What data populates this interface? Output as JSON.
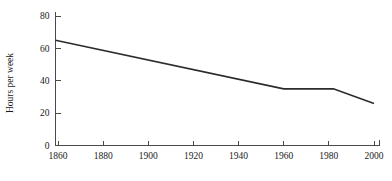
{
  "chart_data": {
    "type": "line",
    "title": "",
    "subtitle": "",
    "xlabel": "",
    "ylabel": "Hours per week",
    "xlim": [
      1855,
      2000
    ],
    "ylim": [
      0,
      80
    ],
    "grid": false,
    "legend": false,
    "legend_position": "none",
    "line_color": "#2b2b2b",
    "axis_color": "#4a4a4a",
    "background_color": "#ffffff",
    "x_ticks": [
      1860,
      1880,
      1900,
      1920,
      1940,
      1960,
      1980,
      2000
    ],
    "x_tick_labels": [
      "1860",
      "1880",
      "1900",
      "1920",
      "1940",
      "1960",
      "1980",
      "2000"
    ],
    "y_ticks": [
      0,
      20,
      40,
      60,
      80
    ],
    "y_tick_labels": [
      "0",
      "20",
      "40",
      "60",
      "80"
    ],
    "series": [
      {
        "name": "Hours per week",
        "x": [
          1855,
          1960,
          1982,
          2000
        ],
        "values": [
          65,
          35,
          35,
          26
        ]
      }
    ],
    "annotations": []
  },
  "axes": {
    "y_title": "Hours per week"
  }
}
